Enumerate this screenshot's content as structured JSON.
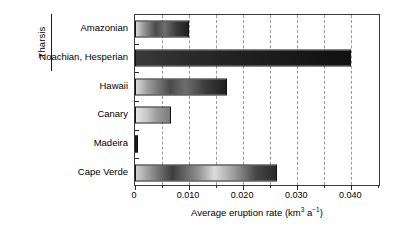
{
  "chart_data": {
    "type": "bar",
    "orientation": "horizontal",
    "title": "",
    "xlabel": "Average eruption rate (km3 a-1)",
    "xlabel_parts": {
      "text_before": "Average eruption rate (km",
      "sup1": "3",
      "middle": " a",
      "sup2": "−1",
      "text_after": ")"
    },
    "ylabel": "",
    "categories": [
      "Amazonian",
      "Noachian, Hesperian",
      "Hawaii",
      "Canary",
      "Madeira",
      "Cape Verde"
    ],
    "values": [
      0.01,
      0.04,
      0.017,
      0.0067,
      0.0004,
      0.0262
    ],
    "xlim": [
      0,
      0.0455
    ],
    "xticks": [
      0,
      0.005,
      0.01,
      0.015,
      0.02,
      0.025,
      0.03,
      0.035,
      0.04,
      0.045
    ],
    "xtick_labels": [
      "0",
      "0.010",
      "0.020",
      "0.030",
      "0.040"
    ],
    "xtick_label_values": [
      0,
      0.01,
      0.02,
      0.03,
      0.04
    ],
    "gridlines": true,
    "gridline_values": [
      0.005,
      0.01,
      0.015,
      0.02,
      0.025,
      0.03,
      0.035,
      0.04
    ],
    "gridline_style": "dashed",
    "legend": null,
    "bar_styles": [
      "gradient-dark",
      "dark",
      "gradient-dark",
      "light",
      "sliver",
      "mixed"
    ],
    "groups": [
      {
        "label": "Tharsis",
        "categories": [
          "Amazonian",
          "Noachian, Hesperian"
        ]
      }
    ],
    "colors": {
      "axis": "#3a3a3a",
      "grid": "#9a9a9a",
      "bar_border": "#121212",
      "background": "#ffffff",
      "text": "#000000"
    }
  }
}
